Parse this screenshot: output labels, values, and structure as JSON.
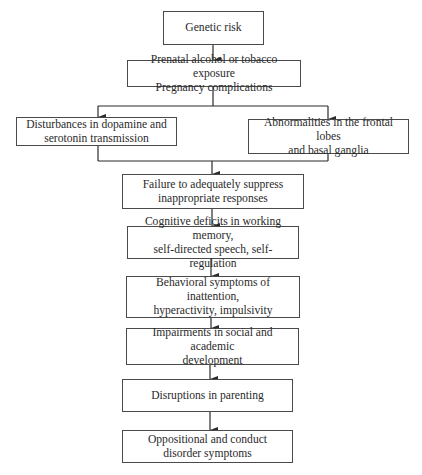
{
  "diagram": {
    "type": "flowchart",
    "nodes": [
      {
        "id": "genetic",
        "label": "Genetic risk"
      },
      {
        "id": "prenatal",
        "label": "Prenatal alcohol or tobacco exposure\nPregnancy complications"
      },
      {
        "id": "dopamine",
        "label": "Disturbances in dopamine and\nserotonin transmission"
      },
      {
        "id": "frontal",
        "label": "Abnormalities in the frontal lobes\nand basal ganglia"
      },
      {
        "id": "failure",
        "label": "Failure to adequately suppress\ninappropriate responses"
      },
      {
        "id": "cognitive",
        "label": "Cognitive deficits in working memory,\nself-directed speech, self-regulation"
      },
      {
        "id": "behavioral",
        "label": "Behavioral symptoms of inattention,\nhyperactivity, impulsivity"
      },
      {
        "id": "impairments",
        "label": "Impairments in social and academic\ndevelopment"
      },
      {
        "id": "parenting",
        "label": "Disruptions in parenting"
      },
      {
        "id": "oppositional",
        "label": "Oppositional and conduct\ndisorder symptoms"
      }
    ],
    "edges": [
      {
        "from": "genetic",
        "to": "prenatal"
      },
      {
        "from": "prenatal",
        "to": "dopamine"
      },
      {
        "from": "prenatal",
        "to": "frontal"
      },
      {
        "from": "dopamine",
        "to": "failure"
      },
      {
        "from": "frontal",
        "to": "failure"
      },
      {
        "from": "failure",
        "to": "cognitive"
      },
      {
        "from": "cognitive",
        "to": "behavioral"
      },
      {
        "from": "behavioral",
        "to": "impairments"
      },
      {
        "from": "impairments",
        "to": "parenting"
      },
      {
        "from": "parenting",
        "to": "oppositional"
      }
    ]
  },
  "colors": {
    "line": "#2a2a2a",
    "border": "#4a4a4a",
    "background": "#ffffff"
  }
}
